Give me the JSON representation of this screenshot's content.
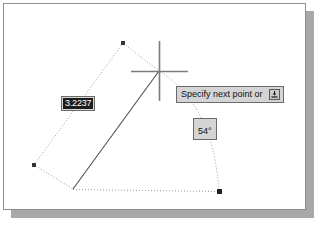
{
  "app": {
    "name": "CAD drawing canvas",
    "background_color": "#ffffff",
    "page_border_color": "#8d8d8d",
    "shadow_color": "#a8a8a8"
  },
  "dynamic_input": {
    "distance_field": {
      "name": "distance-input",
      "value": "3.2237",
      "selected": true,
      "text_color": "#ffffff",
      "highlight_color": "#1c1c1c",
      "border_color": "#6b6b6b"
    },
    "prompt_tooltip": {
      "name": "command-prompt-tooltip",
      "text": "Specify next point or",
      "expand_button_icon": "down-arrow-into-tray-icon",
      "background_color": "#d4d4d4",
      "border_color": "#6b6b6b",
      "text_color": "#111111"
    },
    "angle_field": {
      "name": "angle-input",
      "value": "54°",
      "background_color": "#d4d4d4",
      "border_color": "#6b6b6b",
      "text_color": "#111111"
    }
  },
  "cursor": {
    "name": "crosshair-cursor",
    "center_x": 155,
    "center_y": 67,
    "horizontal_extent": [
      127,
      184
    ],
    "vertical_extent": [
      37,
      97
    ],
    "color": "#7b7b7b"
  },
  "geometry": {
    "rubber_band_line": {
      "name": "rubber-band-line",
      "style": "solid",
      "color": "#555555",
      "from": [
        69,
        185
      ],
      "to": [
        155,
        67
      ]
    },
    "tracking_box": {
      "name": "polar-tracking-box",
      "style": "dotted",
      "color": "#9a9a9a",
      "points": [
        [
          119,
          39
        ],
        [
          30,
          161
        ],
        [
          69,
          185
        ],
        [
          155,
          67
        ]
      ]
    },
    "base_line": {
      "name": "base-tracking-line",
      "style": "dotted",
      "color": "#9a9a9a",
      "from": [
        69,
        185
      ],
      "to": [
        215,
        187
      ]
    },
    "angle_arc": {
      "name": "angle-arc",
      "style": "dotted",
      "color": "#9a9a9a",
      "from": [
        155,
        67
      ],
      "to": [
        215,
        187
      ]
    },
    "vertices": [
      {
        "name": "vertex-marker-top",
        "x": 119,
        "y": 39
      },
      {
        "name": "vertex-marker-left",
        "x": 30,
        "y": 161
      },
      {
        "name": "vertex-marker-bottom-right",
        "x": 215,
        "y": 187
      }
    ],
    "vertex_color": "#333333"
  }
}
